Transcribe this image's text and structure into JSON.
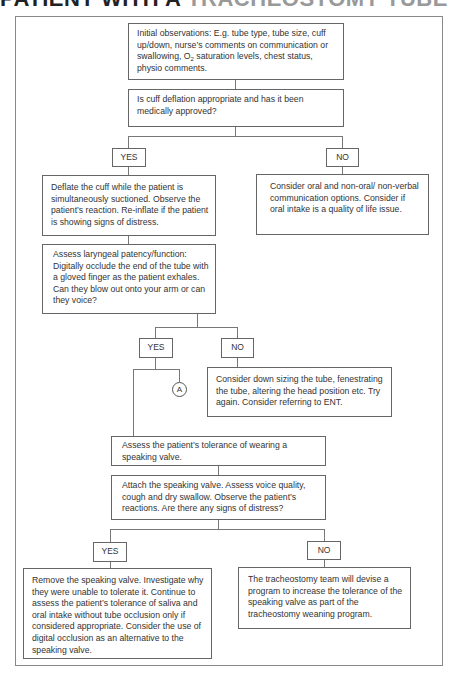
{
  "title": {
    "dark": "PATIENT WITH A ",
    "light": "TRACHEOSTOMY TUBE"
  },
  "nodes": {
    "initial_obs": {
      "pre": "Initial observations: E.g. tube type, tube size, cuff up/down, nurse’s comments on communication or swallowing, O",
      "sub": "2",
      "post": " saturation levels, chest status, physio comments."
    },
    "cuff_question": "Is cuff deflation appropriate and has it been medically approved?",
    "yes1": "YES",
    "no1": "NO",
    "deflate": "Deflate the cuff while the patient is simultaneously suctioned. Observe the patient’s reaction. Re-inflate if the patient is showing signs of distress.",
    "consider_oral": "Consider oral and non-oral/ non-verbal communication options. Consider if oral intake is a quality of life issue.",
    "assess_laryngeal": "Assess laryngeal patency/function: Digitally occlude the end of the tube with a gloved finger as the patient exhales. Can they blow out onto your arm or can they voice?",
    "yes2": "YES",
    "no2": "NO",
    "connector_a": "A",
    "consider_downsizing": "Consider down sizing the tube, fenestrating the tube, altering the head position etc. Try again. Consider referring to ENT.",
    "assess_tolerance": "Assess the patient’s tolerance of wearing a speaking valve.",
    "attach_valve": "Attach the speaking valve. Assess voice quality, cough and dry swallow. Observe the patient’s reactions. Are there any signs of distress?",
    "yes3": "YES",
    "no3": "NO",
    "remove_valve": "Remove the speaking valve. Investigate why they were unable to tolerate it. Continue to assess the patient’s tolerance of saliva and oral intake without tube occlusion only if considered appropriate. Consider the use of digital occlusion as an alternative to the speaking valve.",
    "team_program": "The tracheostomy team will devise a program to increase the tolerance of the speaking valve as part of the tracheostomy weaning program."
  }
}
